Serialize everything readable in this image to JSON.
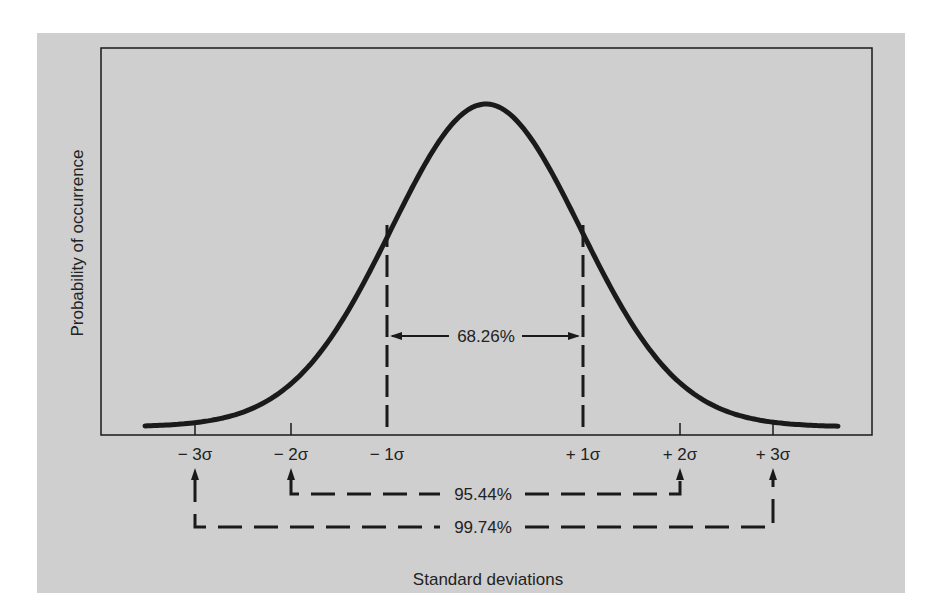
{
  "chart_data": {
    "type": "line",
    "title": "",
    "xlabel": "Standard deviations",
    "ylabel": "Probability of occurrence",
    "grid": false,
    "legend": null,
    "x_ticks": [
      "-3σ",
      "-2σ",
      "-1σ",
      "+1σ",
      "+2σ",
      "+3σ"
    ],
    "x_tick_values": [
      -3,
      -2,
      -1,
      1,
      2,
      3
    ],
    "xlim": [
      -3.6,
      3.6
    ],
    "series": [
      {
        "name": "Normal distribution",
        "shape": "bell curve",
        "x": [
          -3.5,
          -3,
          -2.5,
          -2,
          -1.5,
          -1,
          -0.5,
          0,
          0.5,
          1,
          1.5,
          2,
          2.5,
          3,
          3.5
        ],
        "y": [
          0.0009,
          0.0044,
          0.0175,
          0.054,
          0.1295,
          0.242,
          0.3521,
          0.3989,
          0.3521,
          0.242,
          0.1295,
          0.054,
          0.0175,
          0.0044,
          0.0009
        ]
      }
    ],
    "annotations": [
      {
        "label": "68.26%",
        "range": [
          "-1σ",
          "+1σ"
        ],
        "style": "solid arrows inside plot"
      },
      {
        "label": "95.44%",
        "range": [
          "-2σ",
          "+2σ"
        ],
        "style": "dashed bracket below axis"
      },
      {
        "label": "99.74%",
        "range": [
          "-3σ",
          "+3σ"
        ],
        "style": "dashed bracket below axis"
      }
    ]
  },
  "labels": {
    "ylabel": "Probability of occurrence",
    "xlabel": "Standard deviations",
    "ticks": {
      "m3": "− 3σ",
      "m2": "− 2σ",
      "m1": "− 1σ",
      "p1": "+ 1σ",
      "p2": "+ 2σ",
      "p3": "+ 3σ"
    },
    "pct68": "68.26%",
    "pct95": "95.44%",
    "pct99": "99.74%"
  },
  "colors": {
    "background": "#cfcfcf",
    "ink": "#1a1a1a"
  }
}
